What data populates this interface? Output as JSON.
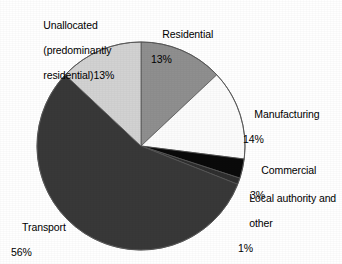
{
  "chart_data": {
    "type": "pie",
    "title": "",
    "subtitle": "",
    "xlabel": "",
    "ylabel": "",
    "legend_position": "none",
    "grid": false,
    "units": "%",
    "start_angle_deg": 0,
    "direction": "clockwise",
    "categories": [
      "Residential",
      "Manufacturing",
      "Commercial",
      "Local authority and other",
      "Transport",
      "Unallocated (predominantly residential)"
    ],
    "values": [
      13,
      14,
      3,
      1,
      56,
      13
    ],
    "slices": [
      {
        "name": "residential",
        "label": "Residential",
        "value": 13,
        "value_text": "13%",
        "color": "#8f8f8f",
        "start_deg": 0,
        "end_deg": 46.8
      },
      {
        "name": "manufacturing",
        "label": "Manufacturing",
        "value": 14,
        "value_text": "14%",
        "color": "#fcfcfc",
        "start_deg": 46.8,
        "end_deg": 97.2
      },
      {
        "name": "commercial",
        "label": "Commercial",
        "value": 3,
        "value_text": "3%",
        "color": "#0a0a0a",
        "start_deg": 97.2,
        "end_deg": 108.0
      },
      {
        "name": "local-authority-and-other",
        "label": "Local authority and\nother",
        "label_line1": "Local authority and",
        "label_line2": "other",
        "value": 1,
        "value_text": "1%",
        "color": "#2e2e2e",
        "start_deg": 108.0,
        "end_deg": 111.6
      },
      {
        "name": "transport",
        "label": "Transport",
        "value": 56,
        "value_text": "56%",
        "color": "#383838",
        "start_deg": 111.6,
        "end_deg": 313.2
      },
      {
        "name": "unallocated",
        "label": "Unallocated\n(predominantly\nresidential)",
        "label_line1": "Unallocated",
        "label_line2": "(predominantly",
        "label_line3": "residential)",
        "value": 13,
        "value_text": "13%",
        "color": "#d2d2d2",
        "start_deg": 313.2,
        "end_deg": 360.0
      }
    ],
    "geometry": {
      "center_x": 141,
      "center_y": 146,
      "radius": 104,
      "outline_color": "#555555"
    },
    "background_color": "#ffffff",
    "text_color": "#000000"
  }
}
